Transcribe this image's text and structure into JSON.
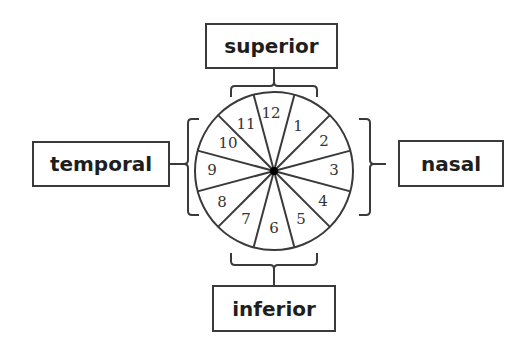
{
  "diagram": {
    "labels": {
      "top": "superior",
      "left": "temporal",
      "right": "nasal",
      "bottom": "inferior"
    },
    "clock_sectors": [
      "12",
      "1",
      "2",
      "3",
      "4",
      "5",
      "6",
      "7",
      "8",
      "9",
      "10",
      "11"
    ],
    "colors": {
      "line": "#3a3a3a",
      "text": "#1e1e1e",
      "background": "#ffffff"
    }
  }
}
